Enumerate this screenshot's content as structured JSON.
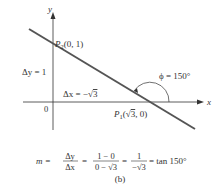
{
  "diagram": {
    "axes": {
      "x_label": "x",
      "y_label": "y",
      "origin_label": "0"
    },
    "points": {
      "p2": {
        "name": "P",
        "sub": "2",
        "coords": "(0, 1)"
      },
      "p1": {
        "name": "P",
        "sub": "1",
        "coords_open": "(",
        "sqrt": "√",
        "sqrt_arg": "3",
        "coords_close": ", 0)"
      }
    },
    "delta_y": {
      "label": "Δy = 1"
    },
    "delta_x": {
      "label": "Δx = −",
      "sqrt": "√",
      "sqrt_arg": "3"
    },
    "angle": {
      "label": "ϕ = 150°"
    },
    "formula": {
      "m": "m =",
      "f1_num": "Δy",
      "f1_den": "Δx",
      "eq1": "=",
      "f2_num": "1 − 0",
      "f2_den": "0 − √3",
      "eq2": "=",
      "f3_num": "1",
      "f3_den": "−√3",
      "eq3": "= tan 150°"
    },
    "caption": "(b)",
    "colors": {
      "line": "#555555",
      "axis": "#333333",
      "text": "#333333"
    }
  }
}
